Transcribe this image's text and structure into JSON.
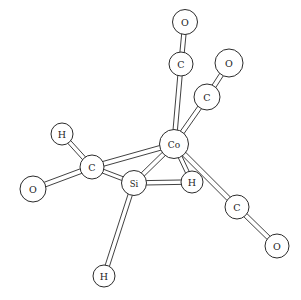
{
  "figure": {
    "background_color": "#ffffff",
    "line_color": "#2b2b2b",
    "atom_fill_color": "#ffffff",
    "width": 301,
    "height": 300
  },
  "atoms": [
    {
      "id": "O_top",
      "label": "O",
      "x": 185,
      "y": 22,
      "r": 12.5,
      "font_size": 9.5
    },
    {
      "id": "C_top",
      "label": "C",
      "x": 181,
      "y": 64,
      "r": 12.0,
      "font_size": 9.5
    },
    {
      "id": "O_upper_right",
      "label": "O",
      "x": 229,
      "y": 63,
      "r": 14.0,
      "font_size": 9.5
    },
    {
      "id": "C_upper_right",
      "label": "C",
      "x": 207,
      "y": 97,
      "r": 13.0,
      "font_size": 9.5
    },
    {
      "id": "Co_center",
      "label": "Co",
      "x": 174,
      "y": 144,
      "r": 14.5,
      "font_size": 9.0
    },
    {
      "id": "H_upper_left",
      "label": "H",
      "x": 62,
      "y": 134,
      "r": 11.0,
      "font_size": 9.5
    },
    {
      "id": "C_acyl_left",
      "label": "C",
      "x": 92,
      "y": 167,
      "r": 12.0,
      "font_size": 9.5
    },
    {
      "id": "O_left",
      "label": "O",
      "x": 33,
      "y": 189,
      "r": 13.0,
      "font_size": 9.5
    },
    {
      "id": "Si_center",
      "label": "Si",
      "x": 134,
      "y": 183,
      "r": 12.5,
      "font_size": 8.5
    },
    {
      "id": "H_bridge",
      "label": "H",
      "x": 192,
      "y": 182,
      "r": 11.0,
      "font_size": 9.5
    },
    {
      "id": "C_lower_right",
      "label": "C",
      "x": 237,
      "y": 207,
      "r": 12.0,
      "font_size": 9.5
    },
    {
      "id": "O_lower_right",
      "label": "O",
      "x": 277,
      "y": 246,
      "r": 12.0,
      "font_size": 9.5
    },
    {
      "id": "H_bottom",
      "label": "H",
      "x": 104,
      "y": 276,
      "r": 11.0,
      "font_size": 9.5
    }
  ],
  "bonds": [
    {
      "from": "O_top",
      "to": "C_top",
      "order": 2,
      "gap": 2.2
    },
    {
      "from": "C_top",
      "to": "Co_center",
      "order": 2,
      "gap": 2.2
    },
    {
      "from": "O_upper_right",
      "to": "C_upper_right",
      "order": 2,
      "gap": 2.2
    },
    {
      "from": "C_upper_right",
      "to": "Co_center",
      "order": 2,
      "gap": 2.2
    },
    {
      "from": "H_upper_left",
      "to": "C_acyl_left",
      "order": 2,
      "gap": 2.0
    },
    {
      "from": "O_left",
      "to": "C_acyl_left",
      "order": 2,
      "gap": 2.4
    },
    {
      "from": "C_acyl_left",
      "to": "Si_center",
      "order": 2,
      "gap": 2.0
    },
    {
      "from": "C_acyl_left",
      "to": "Co_center",
      "order": 2,
      "gap": 2.4
    },
    {
      "from": "Si_center",
      "to": "Co_center",
      "order": 2,
      "gap": 2.2
    },
    {
      "from": "Si_center",
      "to": "H_bridge",
      "order": 2,
      "gap": 2.2
    },
    {
      "from": "Si_center",
      "to": "H_bottom",
      "order": 2,
      "gap": 2.2
    },
    {
      "from": "Co_center",
      "to": "H_bridge",
      "order": 2,
      "gap": 2.0
    },
    {
      "from": "Co_center",
      "to": "C_lower_right",
      "order": 2,
      "gap": 2.4
    },
    {
      "from": "C_lower_right",
      "to": "O_lower_right",
      "order": 2,
      "gap": 2.2
    }
  ]
}
